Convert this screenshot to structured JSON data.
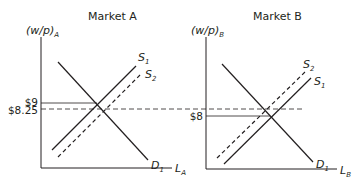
{
  "panels": [
    {
      "title": "Market A",
      "y_axis_label": "(w/p)",
      "y_axis_sub": "A",
      "x_axis_label": "L",
      "x_axis_sub": "A",
      "curves": {
        "supply_1": {
          "label": "S",
          "sub": "1",
          "style": "solid"
        },
        "supply_2": {
          "label": "S",
          "sub": "2",
          "style": "dashed"
        },
        "demand_1": {
          "label": "D",
          "sub": "1",
          "style": "solid"
        }
      },
      "price_levels": [
        {
          "label": "$9",
          "value": 9,
          "style": "solid"
        },
        {
          "label": "$8.25",
          "value": 8.25,
          "style": "dashed"
        }
      ]
    },
    {
      "title": "Market B",
      "y_axis_label": "(w/p)",
      "y_axis_sub": "B",
      "x_axis_label": "L",
      "x_axis_sub": "B",
      "curves": {
        "supply_1": {
          "label": "S",
          "sub": "1",
          "style": "solid"
        },
        "supply_2": {
          "label": "S",
          "sub": "2",
          "style": "dashed"
        },
        "demand_1": {
          "label": "D",
          "sub": "1",
          "style": "solid"
        }
      },
      "price_levels": [
        {
          "label": "$8",
          "value": 8,
          "style": "solid"
        }
      ]
    }
  ],
  "colors": {
    "line": "#231f20",
    "text": "#231f20",
    "background": "#ffffff"
  }
}
